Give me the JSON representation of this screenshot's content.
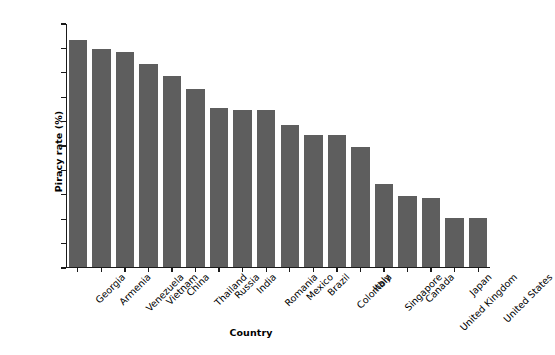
{
  "chart_data": {
    "type": "bar",
    "title": "",
    "xlabel": "Country",
    "ylabel": "Piracy rate (%)",
    "categories": [
      "Georgia",
      "Armenia",
      "Venezuela",
      "Vietnam",
      "China",
      "Thailand",
      "Russia",
      "India",
      "Romania",
      "Mexico",
      "Brazil",
      "Colombia",
      "Italy",
      "Singapore",
      "Canada",
      "United Kingdom",
      "Japan",
      "United States"
    ],
    "values": [
      93,
      89,
      88,
      83,
      78,
      73,
      65,
      64,
      64,
      58,
      54,
      54,
      49,
      34,
      29,
      28,
      20,
      20
    ],
    "ylim": [
      0,
      100
    ],
    "yticks": [
      0,
      10,
      20,
      30,
      40,
      50,
      60,
      70,
      80,
      90,
      100
    ],
    "ytick_labels": [
      "0",
      "10",
      "20",
      "30",
      "40",
      "50",
      "60",
      "70",
      "80",
      "90",
      "100"
    ],
    "grid": false,
    "legend": null,
    "bar_color": "#5e5e5e",
    "axis_color": "#1a1a1a",
    "background_color": "#ffffff"
  }
}
